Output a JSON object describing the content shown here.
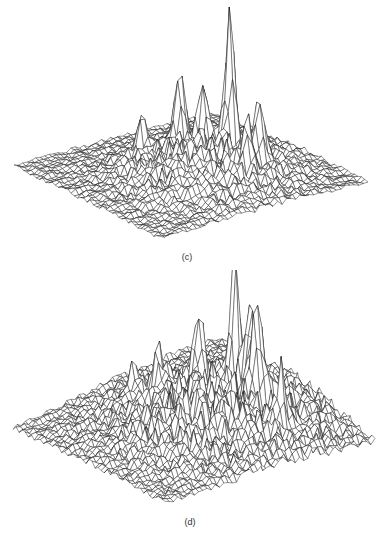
{
  "figure": {
    "background": "#ffffff",
    "line_color": "#1a1a1a",
    "panels": [
      {
        "id": "c",
        "label": "(c)",
        "top": 0,
        "height": 270,
        "label_pos": [
          187,
          252
        ],
        "corners": {
          "left": [
            14,
            167
          ],
          "right": [
            368,
            184
          ],
          "bottom": [
            160,
            240
          ],
          "back": [
            215,
            115
          ]
        },
        "grid": 46,
        "noise_amp": 3.5,
        "central_hump": {
          "u": 0.55,
          "v": 0.45,
          "spread": 0.22,
          "height": 42
        },
        "spikes": [
          {
            "u": 0.5,
            "v": 0.3,
            "height": 150,
            "width": 0.018
          },
          {
            "u": 0.3,
            "v": 0.4,
            "height": 80,
            "width": 0.02
          },
          {
            "u": 0.4,
            "v": 0.36,
            "height": 62,
            "width": 0.02
          },
          {
            "u": 0.66,
            "v": 0.28,
            "height": 65,
            "width": 0.02
          },
          {
            "u": 0.72,
            "v": 0.38,
            "height": 48,
            "width": 0.02
          },
          {
            "u": 0.25,
            "v": 0.55,
            "height": 40,
            "width": 0.02
          }
        ]
      },
      {
        "id": "d",
        "label": "(d)",
        "top": 270,
        "height": 268,
        "label_pos": [
          190,
          247
        ],
        "corners": {
          "left": [
            13,
            160
          ],
          "right": [
            375,
            176
          ],
          "bottom": [
            165,
            235
          ],
          "back": [
            220,
            70
          ]
        },
        "grid": 50,
        "noise_amp": 4.5,
        "central_hump": {
          "u": 0.55,
          "v": 0.4,
          "spread": 0.26,
          "height": 55
        },
        "spikes": [
          {
            "u": 0.47,
            "v": 0.28,
            "height": 130,
            "width": 0.016
          },
          {
            "u": 0.55,
            "v": 0.26,
            "height": 95,
            "width": 0.02
          },
          {
            "u": 0.62,
            "v": 0.28,
            "height": 98,
            "width": 0.02
          },
          {
            "u": 0.4,
            "v": 0.4,
            "height": 72,
            "width": 0.02
          },
          {
            "u": 0.8,
            "v": 0.3,
            "height": 55,
            "width": 0.015
          },
          {
            "u": 0.28,
            "v": 0.5,
            "height": 50,
            "width": 0.02
          },
          {
            "u": 0.18,
            "v": 0.55,
            "height": 30,
            "width": 0.02
          }
        ]
      }
    ]
  }
}
